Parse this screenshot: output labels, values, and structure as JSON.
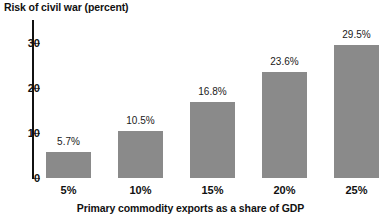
{
  "chart_data": {
    "type": "bar",
    "title": "Risk of civil war (percent)",
    "xlabel": "Primary commodity exports as a share of GDP",
    "ylabel": "Risk of civil war (percent)",
    "categories": [
      "5%",
      "10%",
      "15%",
      "20%",
      "25%"
    ],
    "values": [
      5.7,
      10.5,
      16.8,
      23.6,
      29.5
    ],
    "data_labels": [
      "5.7%",
      "10.5%",
      "16.8%",
      "23.6%",
      "29.5%"
    ],
    "ylim": [
      0,
      33
    ],
    "yticks": [
      0,
      10,
      20,
      30
    ],
    "ytick_labels": [
      "0",
      "10",
      "20",
      "30"
    ],
    "grid": false,
    "legend": null,
    "bar_color": "#8a8a8a",
    "axis_color": "#111111",
    "background_color": "#ffffff"
  },
  "axes": {
    "y": {
      "ticks": [
        {
          "label": "30",
          "value": 30
        },
        {
          "label": "20",
          "value": 20
        },
        {
          "label": "10",
          "value": 10
        },
        {
          "label": "0",
          "value": 0
        }
      ]
    },
    "x": {
      "ticks": [
        {
          "label": "5%"
        },
        {
          "label": "10%"
        },
        {
          "label": "15%"
        },
        {
          "label": "20%"
        },
        {
          "label": "25%"
        }
      ],
      "title": "Primary commodity exports as a share of GDP"
    }
  },
  "bars": [
    {
      "category": "5%",
      "value": 5.7,
      "label": "5.7%"
    },
    {
      "category": "10%",
      "value": 10.5,
      "label": "10.5%"
    },
    {
      "category": "15%",
      "value": 16.8,
      "label": "16.8%"
    },
    {
      "category": "20%",
      "value": 23.6,
      "label": "23.6%"
    },
    {
      "category": "25%",
      "value": 29.5,
      "label": "29.5%"
    }
  ]
}
